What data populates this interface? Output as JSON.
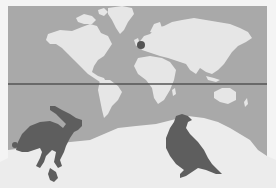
{
  "figure": {
    "type": "illustration",
    "colors": {
      "background": "#f4f4f4",
      "ocean": "#a9a9a9",
      "land": "#e6e6e6",
      "snow": "#ececec",
      "line": "#555555",
      "marker": "#555555",
      "silhouette": "#5e5e5e"
    },
    "marker": {
      "label": "location-marker",
      "region": "Western Europe"
    },
    "reference_line": {
      "label": "horizontal-reference-line"
    },
    "animals": [
      {
        "name": "hare",
        "pose": "running"
      },
      {
        "name": "grouse",
        "pose": "standing"
      }
    ]
  }
}
